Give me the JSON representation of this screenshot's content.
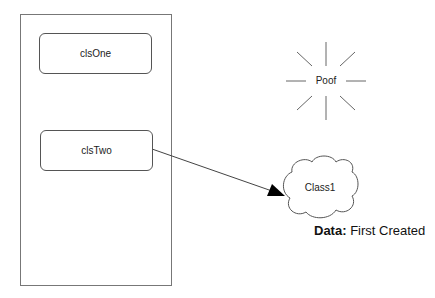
{
  "diagram": {
    "container": {
      "label": ""
    },
    "classes": [
      {
        "id": "clsOne",
        "label": "clsOne"
      },
      {
        "id": "clsTwo",
        "label": "clsTwo"
      }
    ],
    "poof": {
      "label": "Poof"
    },
    "cloud": {
      "label": "Class1"
    },
    "note": {
      "key": "Data:",
      "value": " First Created"
    },
    "colors": {
      "stroke": "#555555",
      "text": "#222222",
      "arrow": "#000000"
    }
  }
}
